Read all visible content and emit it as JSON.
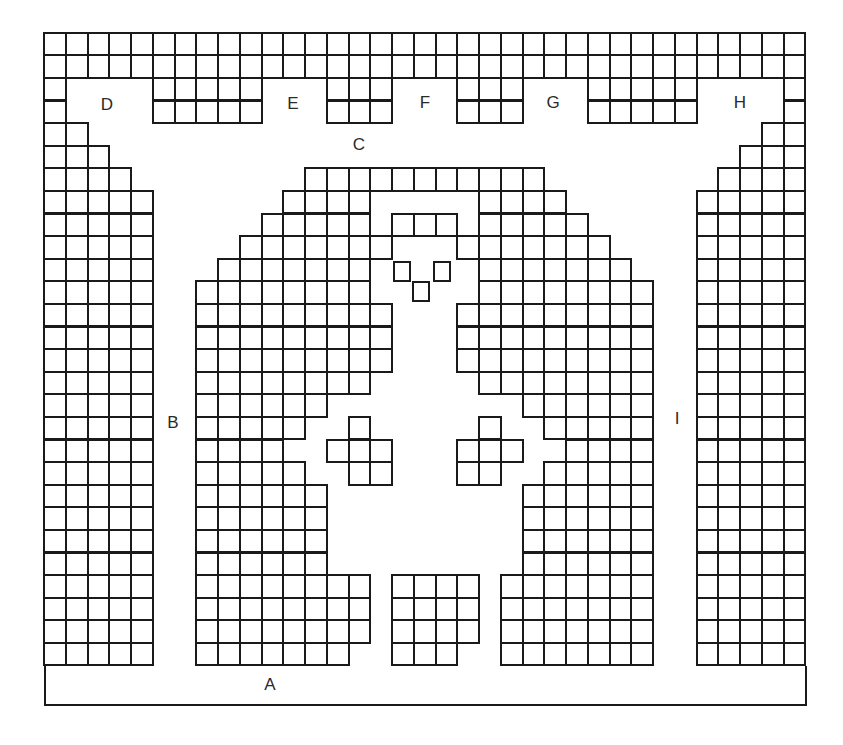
{
  "diagram": {
    "title": "",
    "colors": {
      "line": "#1a1a1a",
      "background": "#ffffff",
      "label": "#2a2a2a"
    },
    "grid": {
      "columns": 35,
      "rows": 28,
      "origin_x": 44,
      "origin_y": 32.7,
      "cell_width": 21.75,
      "cell_height": 22.6,
      "filled_ranges_by_row": [
        [
          [
            0,
            34
          ]
        ],
        [
          [
            0,
            34
          ]
        ],
        [
          [
            0,
            0
          ],
          [
            5,
            9
          ],
          [
            13,
            15
          ],
          [
            19,
            21
          ],
          [
            25,
            29
          ],
          [
            34,
            34
          ]
        ],
        [
          [
            0,
            0
          ],
          [
            5,
            9
          ],
          [
            13,
            15
          ],
          [
            19,
            21
          ],
          [
            25,
            29
          ],
          [
            34,
            34
          ]
        ],
        [
          [
            0,
            1
          ],
          [
            33,
            34
          ]
        ],
        [
          [
            0,
            2
          ],
          [
            32,
            34
          ]
        ],
        [
          [
            0,
            3
          ],
          [
            12,
            22
          ],
          [
            31,
            34
          ]
        ],
        [
          [
            0,
            4
          ],
          [
            11,
            14
          ],
          [
            20,
            23
          ],
          [
            30,
            34
          ]
        ],
        [
          [
            0,
            4
          ],
          [
            10,
            14
          ],
          [
            16,
            18
          ],
          [
            20,
            24
          ],
          [
            30,
            34
          ]
        ],
        [
          [
            0,
            4
          ],
          [
            9,
            15
          ],
          [
            19,
            25
          ],
          [
            30,
            34
          ]
        ],
        [
          [
            0,
            4
          ],
          [
            8,
            14
          ],
          [
            20,
            26
          ],
          [
            30,
            34
          ]
        ],
        [
          [
            0,
            4
          ],
          [
            7,
            14
          ],
          [
            20,
            27
          ],
          [
            30,
            34
          ]
        ],
        [
          [
            0,
            4
          ],
          [
            7,
            15
          ],
          [
            19,
            27
          ],
          [
            30,
            34
          ]
        ],
        [
          [
            0,
            4
          ],
          [
            7,
            15
          ],
          [
            19,
            27
          ],
          [
            30,
            34
          ]
        ],
        [
          [
            0,
            4
          ],
          [
            7,
            15
          ],
          [
            19,
            27
          ],
          [
            30,
            34
          ]
        ],
        [
          [
            0,
            4
          ],
          [
            7,
            14
          ],
          [
            20,
            27
          ],
          [
            30,
            34
          ]
        ],
        [
          [
            0,
            4
          ],
          [
            7,
            12
          ],
          [
            22,
            27
          ],
          [
            30,
            34
          ]
        ],
        [
          [
            0,
            4
          ],
          [
            7,
            11
          ],
          [
            14,
            14
          ],
          [
            20,
            20
          ],
          [
            23,
            27
          ],
          [
            30,
            34
          ]
        ],
        [
          [
            0,
            4
          ],
          [
            7,
            10
          ],
          [
            13,
            15
          ],
          [
            19,
            21
          ],
          [
            24,
            27
          ],
          [
            30,
            34
          ]
        ],
        [
          [
            0,
            4
          ],
          [
            7,
            11
          ],
          [
            14,
            15
          ],
          [
            19,
            20
          ],
          [
            23,
            27
          ],
          [
            30,
            34
          ]
        ],
        [
          [
            0,
            4
          ],
          [
            7,
            12
          ],
          [
            22,
            27
          ],
          [
            30,
            34
          ]
        ],
        [
          [
            0,
            4
          ],
          [
            7,
            12
          ],
          [
            22,
            27
          ],
          [
            30,
            34
          ]
        ],
        [
          [
            0,
            4
          ],
          [
            7,
            12
          ],
          [
            22,
            27
          ],
          [
            30,
            34
          ]
        ],
        [
          [
            0,
            4
          ],
          [
            7,
            12
          ],
          [
            22,
            27
          ],
          [
            30,
            34
          ]
        ],
        [
          [
            0,
            4
          ],
          [
            7,
            14
          ],
          [
            16,
            19
          ],
          [
            21,
            27
          ],
          [
            30,
            34
          ]
        ],
        [
          [
            0,
            4
          ],
          [
            7,
            14
          ],
          [
            16,
            19
          ],
          [
            21,
            27
          ],
          [
            30,
            34
          ]
        ],
        [
          [
            0,
            4
          ],
          [
            7,
            14
          ],
          [
            16,
            19
          ],
          [
            21,
            27
          ],
          [
            30,
            34
          ]
        ],
        [
          [
            0,
            4
          ],
          [
            7,
            13
          ],
          [
            16,
            18
          ],
          [
            21,
            27
          ],
          [
            30,
            34
          ]
        ]
      ]
    },
    "small_squares": [
      {
        "name": "left-eye-square",
        "x": 393,
        "y": 261,
        "w": 18,
        "h": 21
      },
      {
        "name": "right-eye-square",
        "x": 433,
        "y": 261,
        "w": 18,
        "h": 21
      },
      {
        "name": "nose-square",
        "x": 412,
        "y": 281,
        "w": 18,
        "h": 21
      }
    ],
    "floor_bar": {
      "x": 44,
      "y": 666,
      "w": 763,
      "h": 40
    },
    "labels": [
      {
        "id": "A",
        "text": "A",
        "x": 270,
        "y": 684
      },
      {
        "id": "B",
        "text": "B",
        "x": 173,
        "y": 422
      },
      {
        "id": "C",
        "text": "C",
        "x": 359,
        "y": 144
      },
      {
        "id": "D",
        "text": "D",
        "x": 107,
        "y": 104
      },
      {
        "id": "E",
        "text": "E",
        "x": 293,
        "y": 103
      },
      {
        "id": "F",
        "text": "F",
        "x": 425,
        "y": 102
      },
      {
        "id": "G",
        "text": "G",
        "x": 553,
        "y": 102
      },
      {
        "id": "H",
        "text": "H",
        "x": 740,
        "y": 102
      },
      {
        "id": "I",
        "text": "I",
        "x": 677,
        "y": 418
      }
    ]
  }
}
